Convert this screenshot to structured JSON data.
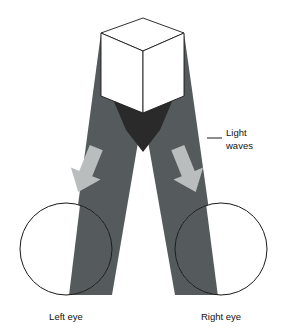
{
  "figure": {
    "background_color": "#ffffff",
    "width": 287,
    "height": 331
  },
  "colors": {
    "beam": "#555a5c",
    "beam_overlap": "#2a2a2a",
    "arrow": "#b9bdbd",
    "outline": "#1a1a1a",
    "cube_face_top": "#ffffff",
    "cube_face_left": "#ffffff",
    "cube_face_right": "#ffffff",
    "label_text": "#111111"
  },
  "labels": {
    "light_waves_line1": "Light",
    "light_waves_line2": "waves",
    "left_eye": "Left eye",
    "right_eye": "Right eye"
  },
  "objects": {
    "cube": {
      "name": "cube",
      "description": "Isometric white cube drawn in outline at top center"
    },
    "left_beam": {
      "name": "left-light-beam",
      "description": "Dark gray wedge from cube travelling down-left to the right eye"
    },
    "right_beam": {
      "name": "right-light-beam",
      "description": "Dark gray wedge from cube travelling down-right to the left eye"
    },
    "left_eye": {
      "name": "left-eye",
      "description": "Outlined circle at bottom left with dark beam band crossing it"
    },
    "right_eye": {
      "name": "right-eye",
      "description": "Outlined circle at bottom right with dark beam band crossing it"
    },
    "left_arrow": {
      "name": "left-direction-arrow",
      "description": "Light gray arrow pointing down-right inside left beam"
    },
    "right_arrow": {
      "name": "right-direction-arrow",
      "description": "Light gray arrow pointing down-left inside right beam"
    },
    "leader_line": {
      "name": "light-waves-leader-line",
      "description": "Short horizontal rule connecting the Light waves label to the beam edge"
    }
  }
}
